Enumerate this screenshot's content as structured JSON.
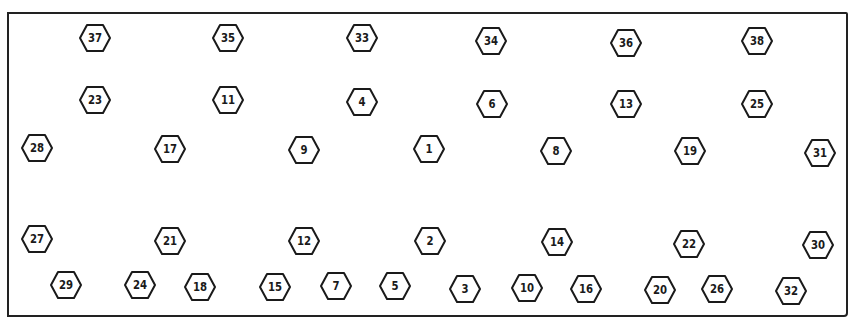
{
  "diagram": {
    "type": "bolt-tightening-sequence",
    "shape": "hexagon",
    "stroke_color": "#1a1a1a",
    "background": "#ffffff",
    "bolts": [
      {
        "label": "37",
        "x": 95,
        "y": 38
      },
      {
        "label": "35",
        "x": 228,
        "y": 38
      },
      {
        "label": "33",
        "x": 362,
        "y": 38
      },
      {
        "label": "34",
        "x": 491,
        "y": 41
      },
      {
        "label": "36",
        "x": 626,
        "y": 43
      },
      {
        "label": "38",
        "x": 757,
        "y": 41
      },
      {
        "label": "23",
        "x": 95,
        "y": 100
      },
      {
        "label": "11",
        "x": 228,
        "y": 100
      },
      {
        "label": "4",
        "x": 362,
        "y": 102
      },
      {
        "label": "6",
        "x": 492,
        "y": 104
      },
      {
        "label": "13",
        "x": 626,
        "y": 104
      },
      {
        "label": "25",
        "x": 757,
        "y": 104
      },
      {
        "label": "28",
        "x": 37,
        "y": 148
      },
      {
        "label": "17",
        "x": 170,
        "y": 149
      },
      {
        "label": "9",
        "x": 304,
        "y": 150
      },
      {
        "label": "1",
        "x": 429,
        "y": 149
      },
      {
        "label": "8",
        "x": 556,
        "y": 151
      },
      {
        "label": "19",
        "x": 690,
        "y": 151
      },
      {
        "label": "31",
        "x": 820,
        "y": 153
      },
      {
        "label": "27",
        "x": 37,
        "y": 239
      },
      {
        "label": "21",
        "x": 170,
        "y": 241
      },
      {
        "label": "12",
        "x": 304,
        "y": 241
      },
      {
        "label": "2",
        "x": 430,
        "y": 241
      },
      {
        "label": "14",
        "x": 557,
        "y": 242
      },
      {
        "label": "22",
        "x": 689,
        "y": 244
      },
      {
        "label": "30",
        "x": 818,
        "y": 245
      },
      {
        "label": "29",
        "x": 66,
        "y": 285
      },
      {
        "label": "24",
        "x": 140,
        "y": 285
      },
      {
        "label": "18",
        "x": 200,
        "y": 287
      },
      {
        "label": "15",
        "x": 275,
        "y": 287
      },
      {
        "label": "7",
        "x": 336,
        "y": 286
      },
      {
        "label": "5",
        "x": 395,
        "y": 286
      },
      {
        "label": "3",
        "x": 465,
        "y": 289
      },
      {
        "label": "10",
        "x": 527,
        "y": 288
      },
      {
        "label": "16",
        "x": 586,
        "y": 289
      },
      {
        "label": "20",
        "x": 660,
        "y": 290
      },
      {
        "label": "26",
        "x": 717,
        "y": 289
      },
      {
        "label": "32",
        "x": 791,
        "y": 291
      }
    ]
  }
}
